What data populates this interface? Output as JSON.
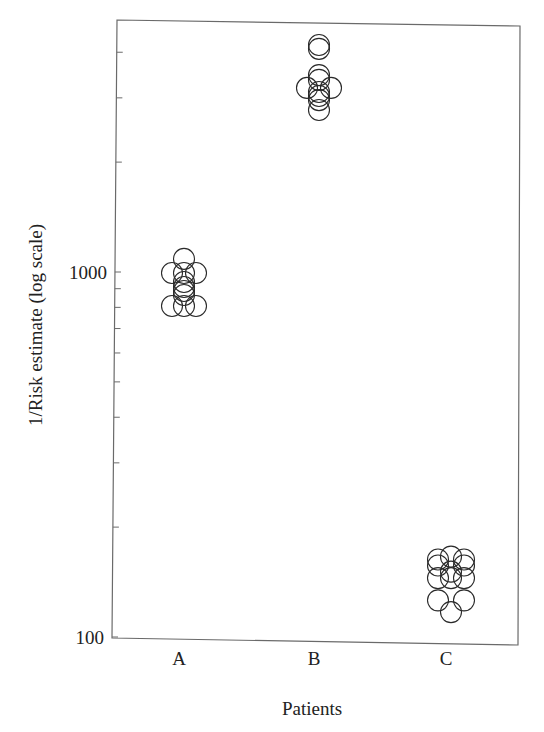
{
  "chart_data": {
    "type": "scatter",
    "title": "",
    "xlabel": "Patients",
    "ylabel": "1/Risk estimate (log scale)",
    "yscale": "log",
    "ylim": [
      100,
      4900
    ],
    "y_ticks_labeled": [
      100,
      1000
    ],
    "y_tick_labels": [
      "100",
      "1000"
    ],
    "y_minor_ticks": [
      200,
      300,
      400,
      500,
      600,
      700,
      800,
      900,
      2000,
      3000,
      4000
    ],
    "categories": [
      "A",
      "B",
      "C"
    ],
    "grid": false,
    "legend": null,
    "marker": "open-circle",
    "series": [
      {
        "name": "A",
        "points": [
          {
            "dx": 0,
            "y": 1086
          },
          {
            "dx": -12,
            "y": 994
          },
          {
            "dx": 0,
            "y": 994
          },
          {
            "dx": 12,
            "y": 994
          },
          {
            "dx": 0,
            "y": 939
          },
          {
            "dx": 0,
            "y": 910
          },
          {
            "dx": 0,
            "y": 887
          },
          {
            "dx": 0,
            "y": 865
          },
          {
            "dx": -12,
            "y": 807
          },
          {
            "dx": 0,
            "y": 807
          },
          {
            "dx": 12,
            "y": 807
          }
        ]
      },
      {
        "name": "B",
        "points": [
          {
            "dx": 0,
            "y": 4186
          },
          {
            "dx": 0,
            "y": 4087
          },
          {
            "dx": 0,
            "y": 3463
          },
          {
            "dx": 0,
            "y": 3360
          },
          {
            "dx": -12,
            "y": 3194
          },
          {
            "dx": 12,
            "y": 3194
          },
          {
            "dx": 0,
            "y": 3113
          },
          {
            "dx": 0,
            "y": 3035
          },
          {
            "dx": 0,
            "y": 2958
          },
          {
            "dx": 0,
            "y": 2778
          }
        ]
      },
      {
        "name": "C",
        "points": [
          {
            "dx": 0,
            "y": 166
          },
          {
            "dx": -13,
            "y": 163
          },
          {
            "dx": 13,
            "y": 163
          },
          {
            "dx": -13,
            "y": 157
          },
          {
            "dx": 13,
            "y": 157
          },
          {
            "dx": 0,
            "y": 151
          },
          {
            "dx": -13,
            "y": 145
          },
          {
            "dx": 0,
            "y": 145
          },
          {
            "dx": 13,
            "y": 145
          },
          {
            "dx": -13,
            "y": 126
          },
          {
            "dx": 13,
            "y": 126
          },
          {
            "dx": 0,
            "y": 117
          }
        ]
      }
    ]
  }
}
